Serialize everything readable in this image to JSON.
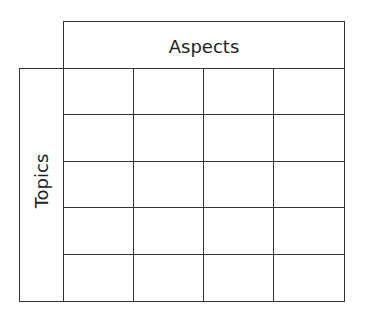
{
  "diagram": {
    "column_header": "Aspects",
    "row_header": "Topics",
    "grid": {
      "rows": 5,
      "columns": 4
    },
    "line_color": "#333333"
  }
}
